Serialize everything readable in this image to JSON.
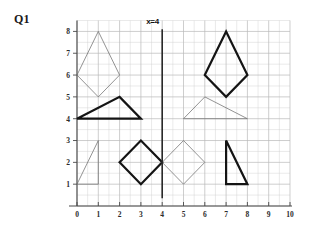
{
  "worksheet": {
    "question_label": "Q1",
    "background_color": "#ffffff"
  },
  "chart_data": {
    "type": "scatter",
    "title": "Q1",
    "xlabel": "",
    "ylabel": "",
    "xlim": [
      0,
      10
    ],
    "ylim": [
      0,
      8.5
    ],
    "grid": true,
    "grid_color": "#b9b9b9",
    "grid_minor_step": 0.5,
    "grid_major_step": 1,
    "x_ticks": [
      "0",
      "1",
      "2",
      "3",
      "4",
      "5",
      "6",
      "7",
      "8",
      "9",
      "10"
    ],
    "x_tick_values": [
      0,
      1,
      2,
      3,
      4,
      5,
      6,
      7,
      8,
      9,
      10
    ],
    "y_ticks": [
      "1",
      "2",
      "3",
      "4",
      "5",
      "6",
      "7",
      "8"
    ],
    "y_tick_values": [
      1,
      2,
      3,
      4,
      5,
      6,
      7,
      8
    ],
    "annotations": [
      {
        "name": "mirror-line-label",
        "text": "x=4",
        "x": 3.55,
        "y": 8.35
      }
    ],
    "mirror_line": {
      "label": "x=4",
      "x": 4,
      "y_from": 0.35,
      "y_to": 8.1,
      "color": "#2a2a2a",
      "width": 1.6
    },
    "shapes": [
      {
        "name": "kite-upper-left",
        "kind": "kite",
        "stroke": "thin",
        "color": "#6f6f6f",
        "points": [
          [
            0,
            6
          ],
          [
            1,
            8
          ],
          [
            2,
            6
          ],
          [
            1,
            5
          ]
        ]
      },
      {
        "name": "kite-upper-right",
        "kind": "kite",
        "stroke": "thick",
        "color": "#141414",
        "points": [
          [
            6,
            6
          ],
          [
            7,
            8
          ],
          [
            8,
            6
          ],
          [
            7,
            5
          ]
        ]
      },
      {
        "name": "triangle-middle-left",
        "kind": "triangle",
        "stroke": "thick",
        "color": "#141414",
        "points": [
          [
            0,
            4
          ],
          [
            2,
            5
          ],
          [
            3,
            4
          ]
        ]
      },
      {
        "name": "triangle-middle-right",
        "kind": "triangle",
        "stroke": "thin",
        "color": "#6f6f6f",
        "points": [
          [
            5,
            4
          ],
          [
            6,
            5
          ],
          [
            8,
            4
          ]
        ]
      },
      {
        "name": "triangle-lower-left",
        "kind": "triangle",
        "stroke": "thin",
        "color": "#6f6f6f",
        "points": [
          [
            0,
            1
          ],
          [
            1,
            3
          ],
          [
            1,
            1
          ]
        ]
      },
      {
        "name": "diamond-lower-left",
        "kind": "diamond",
        "stroke": "thick",
        "color": "#141414",
        "points": [
          [
            2,
            2
          ],
          [
            3,
            3
          ],
          [
            4,
            2
          ],
          [
            3,
            1
          ]
        ]
      },
      {
        "name": "diamond-lower-right",
        "kind": "diamond",
        "stroke": "thin",
        "color": "#6f6f6f",
        "points": [
          [
            4,
            2
          ],
          [
            5,
            3
          ],
          [
            6,
            2
          ],
          [
            5,
            1
          ]
        ]
      },
      {
        "name": "triangle-lower-right",
        "kind": "triangle",
        "stroke": "thick",
        "color": "#141414",
        "points": [
          [
            7,
            3
          ],
          [
            7,
            1
          ],
          [
            8,
            1
          ]
        ]
      }
    ]
  }
}
